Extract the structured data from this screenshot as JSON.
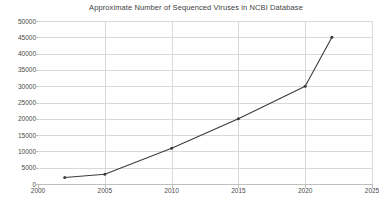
{
  "chart_data": {
    "type": "line",
    "title": "Approximate Number of Sequenced Viruses in NCBI Database",
    "xlabel": "",
    "ylabel": "",
    "x": [
      2002,
      2005,
      2010,
      2015,
      2020,
      2022
    ],
    "values": [
      2000,
      3000,
      11000,
      20000,
      30000,
      45000
    ],
    "series": [
      {
        "name": "Sequenced Viruses",
        "x": [
          2002,
          2005,
          2010,
          2015,
          2020,
          2022
        ],
        "values": [
          2000,
          3000,
          11000,
          20000,
          30000,
          45000
        ]
      }
    ],
    "xlim": [
      2000,
      2025
    ],
    "ylim": [
      0,
      50000
    ],
    "xticks": [
      2000,
      2005,
      2010,
      2015,
      2020,
      2025
    ],
    "xtick_labels": [
      "2000",
      "2005",
      "2010",
      "2015",
      "2020",
      "2025"
    ],
    "yticks": [
      0,
      5000,
      10000,
      15000,
      20000,
      25000,
      30000,
      35000,
      40000,
      45000,
      50000
    ],
    "ytick_labels": [
      "0",
      "5000",
      "10000",
      "15000",
      "20000",
      "25000",
      "30000",
      "35000",
      "40000",
      "45000",
      "50000"
    ],
    "grid": "both",
    "legend": "none",
    "marker": "dot",
    "line_color": "#3c3c3c",
    "grid_color": "#d9d9d9",
    "axis_color": "#bfbfbf",
    "background_color": "#ffffff",
    "text_color": "#4a4a4a"
  }
}
